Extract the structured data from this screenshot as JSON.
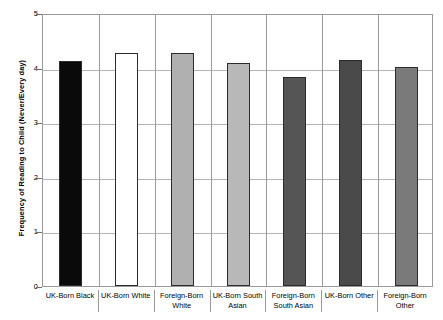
{
  "chart_data": {
    "type": "bar",
    "title": "",
    "xlabel": "",
    "ylabel": "Frequency of Reading to Child (Never/Every day)",
    "ylim": [
      0,
      5
    ],
    "ytick_labels": [
      "5",
      "4",
      "3",
      "2",
      "1",
      "0"
    ],
    "ytick_values": [
      5,
      4,
      3,
      2,
      1,
      0
    ],
    "grid": true,
    "legend": "none",
    "categories": [
      "UK-Born Black",
      "UK-Born White",
      "Foreign-Born White",
      "UK-Born South Asian",
      "Foreign-Born South Asian",
      "UK-Born Other",
      "Foreign-Born Other"
    ],
    "values": [
      4.12,
      4.26,
      4.26,
      4.09,
      3.82,
      4.14,
      4.01
    ],
    "bar_colors": [
      "#0a0a0a",
      "#ffffff",
      "#b0b0b0",
      "#b8b8b8",
      "#555555",
      "#4a4a4a",
      "#7a7a7a"
    ],
    "bar_border_color": "#2b2b2b",
    "gridline_color": "#b4b4b4",
    "axis_color": "#9a9a9a"
  }
}
